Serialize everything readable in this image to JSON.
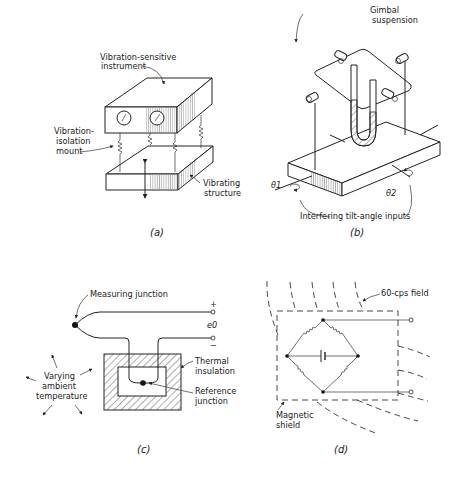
{
  "figure": {
    "panels": [
      {
        "id": "a",
        "caption": "(a)",
        "labels": {
          "instrument": [
            "Vibration-sensitive",
            "instrument"
          ],
          "mount": [
            "Vibration-",
            "isolation",
            "mount"
          ],
          "structure": [
            "Vibrating",
            "structure"
          ]
        }
      },
      {
        "id": "b",
        "caption": "(b)",
        "labels": {
          "gimbal": [
            "Gimbal",
            "suspension"
          ],
          "theta1": "θ1",
          "theta2": "θ2",
          "inputs": "Interfering tilt-angle inputs"
        }
      },
      {
        "id": "c",
        "caption": "(c)",
        "labels": {
          "measuring": "Measuring junction",
          "plus": "+",
          "minus": "−",
          "eo": "e0",
          "ambient": [
            "Varying",
            "ambient",
            "temperature"
          ],
          "insulation": [
            "Thermal",
            "insulation"
          ],
          "reference": [
            "Reference",
            "junction"
          ]
        }
      },
      {
        "id": "d",
        "caption": "(d)",
        "labels": {
          "field": "60-cps field",
          "shield": [
            "Magnetic",
            "shield"
          ]
        }
      }
    ]
  }
}
